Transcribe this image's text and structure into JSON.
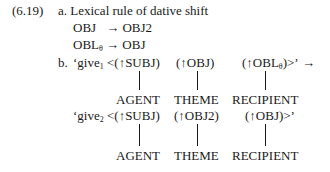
{
  "example": {
    "number": "(6.19)",
    "part_a": {
      "label": "a. Lexical rule of dative shift",
      "rules": [
        {
          "lhs": "OBJ",
          "lhs_sub": "",
          "arrow": "→",
          "rhs": "OBJ2"
        },
        {
          "lhs": "OBL",
          "lhs_sub": "θ",
          "arrow": "→",
          "rhs": "OBJ"
        }
      ]
    },
    "part_b": {
      "label": "b.",
      "give1": {
        "pred": "‘give",
        "pred_sub": "1",
        "open": "<(↑SUBJ)",
        "arg2": "(↑OBJ)",
        "arg3": "(↑OBL",
        "arg3_sub": "θ",
        "arg3_close": ")>’",
        "arrow": "→",
        "roles": [
          "AGENT",
          "THEME",
          "RECIPIENT"
        ]
      },
      "give2": {
        "pred": "‘give",
        "pred_sub": "2",
        "open": "<(↑SUBJ)",
        "arg2": "(↑OBJ2)",
        "arg3": "(↑OBJ)>’",
        "roles": [
          "AGENT",
          "THEME",
          "RECIPIENT"
        ]
      }
    }
  }
}
